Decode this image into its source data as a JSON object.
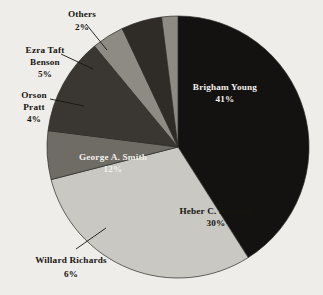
{
  "chart_data": {
    "type": "pie",
    "title": "",
    "subtitle": "",
    "xlabel": "",
    "ylabel": "",
    "legend_position": "none",
    "grid": false,
    "units": "percent",
    "total": 100,
    "categories": [
      "Brigham Young",
      "Heber C. Kimball",
      "Willard Richards",
      "George A. Smith",
      "Orson Pratt",
      "Ezra Taft Benson",
      "Others"
    ],
    "values": [
      41,
      30,
      6,
      12,
      4,
      5,
      2
    ],
    "slices": [
      {
        "name": "Brigham Young",
        "value": 41,
        "label": "Brigham Young",
        "percent_label": "41%",
        "color": "#141210",
        "text_color": "#f2f0ec",
        "label_placement": "inside"
      },
      {
        "name": "Heber C. Kimball",
        "value": 30,
        "label": "Heber C. Kimball",
        "percent_label": "30%",
        "color": "#c9c8c2",
        "text_color": "#17150f",
        "label_placement": "inside"
      },
      {
        "name": "Willard Richards",
        "value": 6,
        "label": "Willard Richards",
        "percent_label": "6%",
        "color": "#6f6c66",
        "text_color": "#17150f",
        "label_placement": "outside"
      },
      {
        "name": "George A. Smith",
        "value": 12,
        "label": "George A. Smith",
        "percent_label": "12%",
        "color": "#3a3733",
        "text_color": "#f2f0ec",
        "label_placement": "inside"
      },
      {
        "name": "Orson Pratt",
        "value": 4,
        "label": "Orson Pratt",
        "label_line1": "Orson",
        "label_line2": "Pratt",
        "percent_label": "4%",
        "color": "#8e8b85",
        "text_color": "#17150f",
        "label_placement": "outside"
      },
      {
        "name": "Ezra Taft Benson",
        "value": 5,
        "label": "Ezra Taft Benson",
        "label_line1": "Ezra Taft",
        "label_line2": "Benson",
        "percent_label": "5%",
        "color": "#2f2c28",
        "text_color": "#17150f",
        "label_placement": "outside"
      },
      {
        "name": "Others",
        "value": 2,
        "label": "Others",
        "percent_label": "2%",
        "color": "#8e8b85",
        "text_color": "#17150f",
        "label_placement": "outside"
      }
    ]
  },
  "background_color": "#efedea"
}
